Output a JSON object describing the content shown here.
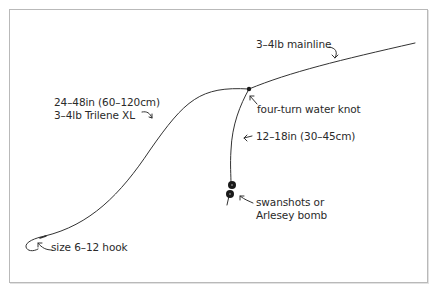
{
  "diagram": {
    "colors": {
      "line": "#333333",
      "text": "#2a2a2a",
      "border": "#b9b9b9",
      "shot": "#1a1a1a"
    },
    "labels": {
      "mainline": "3–4lb mainline",
      "hooklength_1": "24–48in (60–120cm)",
      "hooklength_2": "3–4lb Trilene XL",
      "knot": "four-turn water knot",
      "link_length": "12–18in (30–45cm)",
      "weight_1": "swanshots or",
      "weight_2": "Arlesey bomb",
      "hook": "size 6–12 hook"
    },
    "components": [
      {
        "name": "mainline",
        "icon": "line"
      },
      {
        "name": "hooklength",
        "icon": "line"
      },
      {
        "name": "water-knot",
        "icon": "knot-dot"
      },
      {
        "name": "link",
        "icon": "line"
      },
      {
        "name": "swanshots",
        "icon": "shot-circles"
      },
      {
        "name": "hook",
        "icon": "hook"
      }
    ]
  }
}
